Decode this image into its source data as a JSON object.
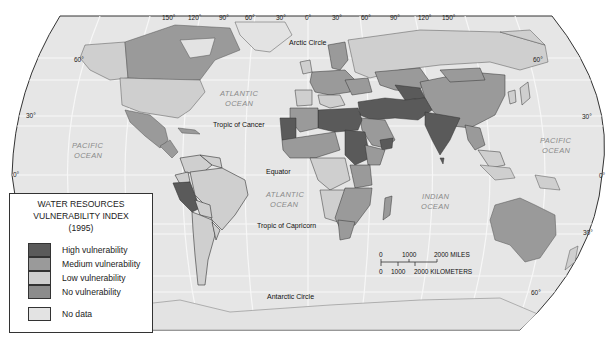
{
  "map": {
    "title": "Water Resources Vulnerability Index (1995)",
    "projection": "Robinson",
    "colors": {
      "ocean": "#e6e6e6",
      "graticule": "#f7f7f7",
      "outline": "#333333",
      "high": "#5a5a5a",
      "medium": "#9a9a9a",
      "low": "#cfcfcf",
      "none": "#8c8c8c",
      "nodata": "#e3e3e3"
    },
    "top_longitude_labels": [
      "150°",
      "120°",
      "90°",
      "60°",
      "30°",
      "0°",
      "30°",
      "60°",
      "90°",
      "120°",
      "150°"
    ],
    "left_latitude_labels": [
      "60°",
      "30°",
      "0°"
    ],
    "right_latitude_labels": [
      "60°",
      "30°",
      "0°",
      "30°",
      "60°"
    ],
    "line_labels": {
      "arctic_circle": "Arctic Circle",
      "tropic_cancer": "Tropic of Cancer",
      "equator": "Equator",
      "tropic_capricorn": "Tropic of Capricorn",
      "antarctic_circle": "Antarctic Circle"
    },
    "oceans": {
      "pacific_left_1": "PACIFIC",
      "pacific_left_2": "OCEAN",
      "atlantic_north_1": "ATLANTIC",
      "atlantic_north_2": "OCEAN",
      "atlantic_south_1": "ATLANTIC",
      "atlantic_south_2": "OCEAN",
      "indian_1": "INDIAN",
      "indian_2": "OCEAN",
      "pacific_right_1": "PACIFIC",
      "pacific_right_2": "OCEAN"
    }
  },
  "legend": {
    "title_line1": "WATER RESOURCES",
    "title_line2": "VULNERABILITY INDEX",
    "title_line3": "(1995)",
    "items": [
      {
        "label": "High vulnerability",
        "color": "#5a5a5a"
      },
      {
        "label": "Medium vulnerability",
        "color": "#9a9a9a"
      },
      {
        "label": "Low vulnerability",
        "color": "#cfcfcf"
      },
      {
        "label": "No vulnerability",
        "color": "#8c8c8c"
      },
      {
        "label": "No data",
        "color": "#e3e3e3"
      }
    ]
  },
  "scale_bar": {
    "miles_ticks": [
      "0",
      "1000",
      "2000 MILES"
    ],
    "km_ticks": [
      "0",
      "1000",
      "2000 KILOMETERS"
    ]
  }
}
